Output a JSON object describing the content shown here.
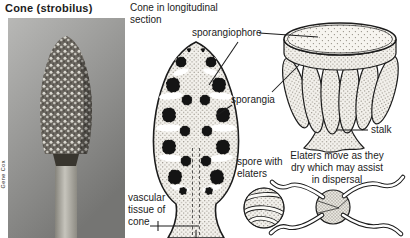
{
  "photo_panel": {
    "title": "Cone (strobilus)",
    "credit": "Gene Cox"
  },
  "longitudinal_section": {
    "heading": "Cone in longitudinal section",
    "labels": {
      "sporangiophore": "sporangiophore",
      "sporangia": "sporangia",
      "spore_with_elaters": "spore with elaters",
      "vascular_tissue": "vascular tissue of cone"
    }
  },
  "sporangiophore_figure": {
    "stalk_label": "stalk"
  },
  "elaters_figure": {
    "caption": "Elaters move as they dry which may assist in dispersal"
  },
  "colors": {
    "ink": "#1c1c1c",
    "paper": "#ffffff",
    "spor": "#141414",
    "stipdot": "#8f8a80",
    "photo_light": "#b8b8b6",
    "photo_dark": "#757573"
  }
}
